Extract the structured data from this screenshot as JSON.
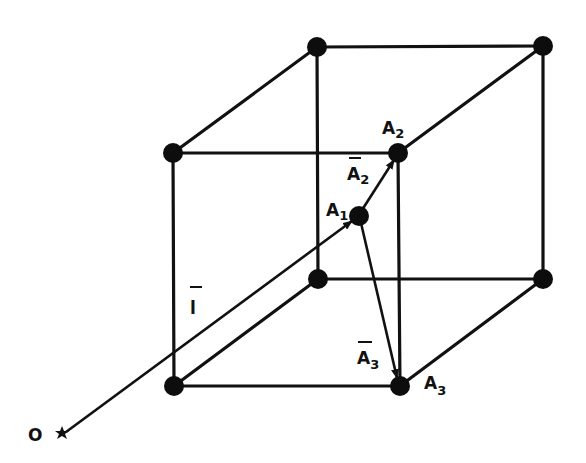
{
  "diagram": {
    "type": "lattice-cube-vector-diagram",
    "nodes": [
      {
        "id": "front-top-left",
        "x": 173,
        "y": 153
      },
      {
        "id": "A2",
        "x": 398,
        "y": 153
      },
      {
        "id": "front-bottom-left",
        "x": 174,
        "y": 386
      },
      {
        "id": "A3",
        "x": 400,
        "y": 386
      },
      {
        "id": "back-top-left",
        "x": 317,
        "y": 47
      },
      {
        "id": "back-top-right",
        "x": 543,
        "y": 46
      },
      {
        "id": "back-bottom-left",
        "x": 318,
        "y": 279
      },
      {
        "id": "back-bottom-right",
        "x": 543,
        "y": 279
      },
      {
        "id": "A1",
        "x": 359,
        "y": 216
      }
    ],
    "labels": {
      "origin": "O",
      "a1": {
        "main": "A",
        "sub": "1"
      },
      "a2": {
        "main": "A",
        "sub": "2"
      },
      "a3": {
        "main": "A",
        "sub": "3"
      },
      "vec_l": {
        "main": "l",
        "arrow": true
      },
      "vec_a2": {
        "main": "A",
        "sub": "2",
        "arrow": true
      },
      "vec_a3": {
        "main": "A",
        "sub": "3",
        "arrow": true
      }
    },
    "vectors": [
      {
        "name": "l",
        "from": "O",
        "to": "A1"
      },
      {
        "name": "A2",
        "from": "A1",
        "to": "A2"
      },
      {
        "name": "A3",
        "from": "A1",
        "to": "A3"
      }
    ],
    "colors": {
      "ink": "#111111",
      "background": "#ffffff"
    }
  }
}
